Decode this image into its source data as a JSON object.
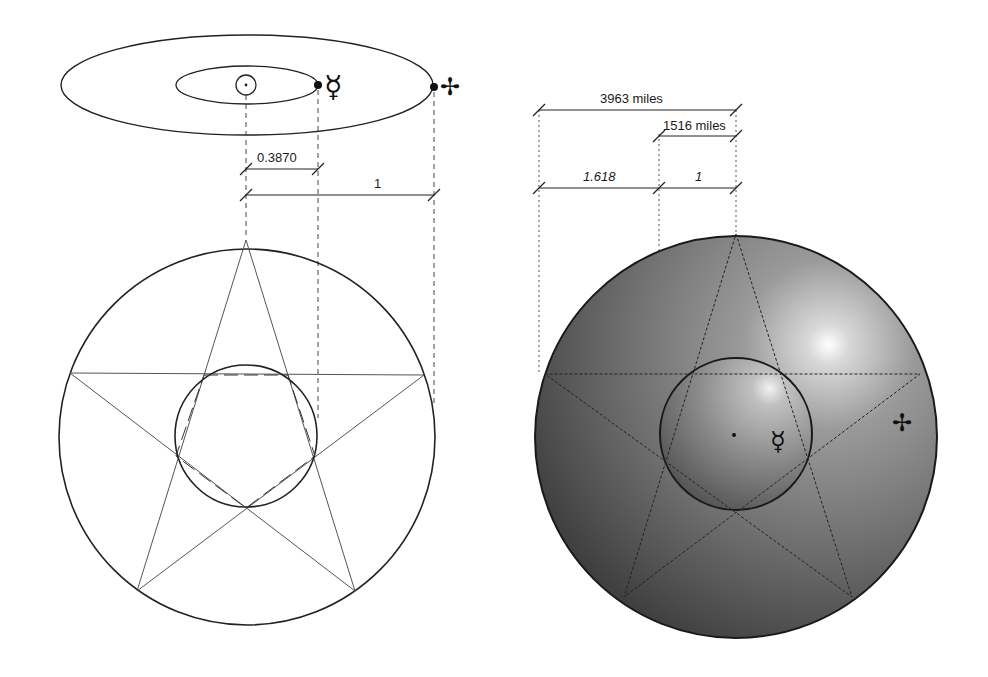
{
  "figure": {
    "left_panel": {
      "orbits": {
        "sun_symbol": "☉",
        "mercury_symbol": "☿",
        "earth_symbol": "✢",
        "inner_orbit_label": "Mercury orbit",
        "outer_orbit_label": "Earth orbit"
      },
      "dimensions": {
        "mercury_distance": "0.3870",
        "earth_distance": "1"
      }
    },
    "right_panel": {
      "dimensions": {
        "earth_radius": "3963 miles",
        "mercury_radius": "1516 miles",
        "ratio_large": "1.618",
        "ratio_small": "1"
      },
      "symbols": {
        "mercury_symbol": "☿",
        "earth_symbol": "✢"
      }
    },
    "colors": {
      "line": "#222222",
      "thin_line": "#555555",
      "sphere_dark": "#3a3a3a",
      "sphere_mid": "#7a7a7a",
      "highlight": "#ffffff"
    }
  }
}
